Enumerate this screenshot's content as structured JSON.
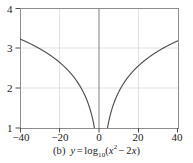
{
  "figure": {
    "label": "(b)",
    "equation_plain": "y = log10(x^2 - 2x)",
    "caption_parts": {
      "y": "y",
      "eq": "=",
      "log": "log",
      "base": "10",
      "open": "(",
      "x1": "x",
      "exp": "2",
      "minus": "−",
      "coef": "2",
      "x2": "x",
      "close": ")"
    }
  },
  "axes": {
    "x_ticks": [
      "−40",
      "−20",
      "0",
      "20",
      "40"
    ],
    "x_tick_values": [
      -40,
      -20,
      0,
      20,
      40
    ],
    "y_ticks": [
      "1",
      "2",
      "3",
      "4"
    ],
    "y_tick_values": [
      1,
      2,
      3,
      4
    ],
    "xlim": [
      -40,
      40
    ],
    "ylim": [
      1,
      4
    ],
    "grid": true,
    "grid_color": "#d9d9d9",
    "axis_color": "#8c8c8c",
    "frame_color": "#8c8c8c",
    "curve_color": "#4d4d4d"
  },
  "chart_data": {
    "type": "line",
    "title": "",
    "subtitle": "",
    "xlabel": "",
    "ylabel": "",
    "xlim": [
      -40,
      40
    ],
    "ylim": [
      1,
      4
    ],
    "grid": true,
    "legend": null,
    "xticks": [
      -40,
      -20,
      0,
      20,
      40
    ],
    "xticklabels": [
      "−40",
      "−20",
      "0",
      "20",
      "40"
    ],
    "yticks": [
      1,
      2,
      3,
      4
    ],
    "yticklabels": [
      "1",
      "2",
      "3",
      "4"
    ],
    "annotations": [
      "(b)  y = log10(x^2 − 2x)"
    ],
    "function": "y = log10(x^2 - 2x)",
    "asymptotes": [
      0,
      2
    ],
    "series": [
      {
        "name": "left-branch",
        "x": [
          -40,
          -38,
          -36,
          -34,
          -32,
          -30,
          -28,
          -26,
          -24,
          -22,
          -20,
          -18,
          -16,
          -14,
          -12,
          -10,
          -9,
          -8,
          -7,
          -6,
          -5,
          -4,
          -3.5,
          -3,
          -2.5,
          -2,
          -1.6,
          -1.3,
          -1.1,
          -0.95,
          -0.85,
          -0.8
        ],
        "y": [
          3.223,
          3.178,
          3.131,
          3.082,
          3.031,
          3.978,
          2.921,
          2.86,
          2.796,
          2.728,
          2.643,
          2.556,
          2.458,
          2.348,
          2.223,
          2.079,
          1.996,
          1.903,
          1.799,
          1.681,
          1.544,
          1.38,
          1.285,
          1.176,
          1.049,
          0.903,
          0.763,
          0.626,
          0.521,
          0.451,
          0.399,
          0.371
        ]
      },
      {
        "name": "right-branch",
        "x": [
          2.8,
          2.95,
          3.1,
          3.3,
          3.6,
          4,
          4.5,
          5,
          5.5,
          6,
          7,
          8,
          9,
          10,
          12,
          14,
          16,
          18,
          20,
          22,
          24,
          26,
          28,
          30,
          32,
          34,
          36,
          38,
          40
        ],
        "y": [
          0.352,
          0.427,
          0.493,
          0.569,
          0.667,
          0.778,
          0.892,
          0.988,
          1.071,
          1.143,
          1.262,
          1.359,
          1.441,
          1.512,
          1.631,
          1.727,
          1.808,
          1.878,
          1.94,
          1.995,
          2.044,
          2.089,
          2.131,
          2.169,
          2.205,
          2.238,
          2.27,
          2.3,
          2.328
        ]
      }
    ],
    "note": "Plotted curve is clipped to y range [1,4]; both branches rise from y=1 near the asymptotes x=0 and x=2 toward about y=3.2 at x=±40"
  }
}
